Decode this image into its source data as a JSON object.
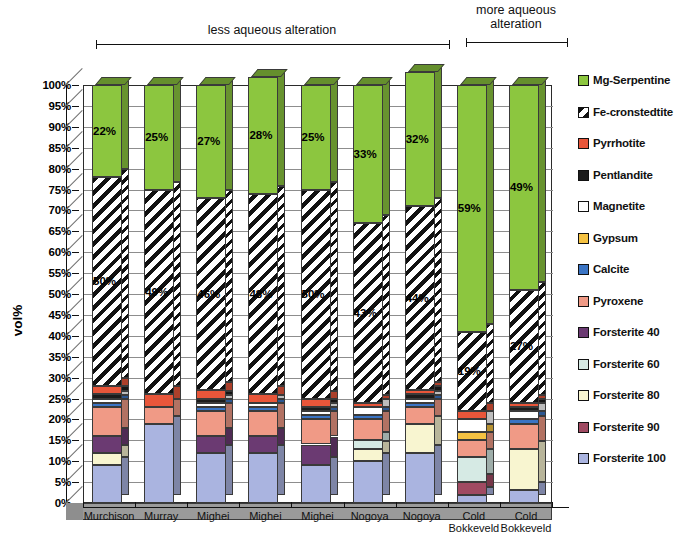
{
  "annotations": {
    "less": "less aqueous alteration",
    "more": "more aqueous\nalteration"
  },
  "axis": {
    "ylabel": "vol%",
    "yticks": [
      "100%",
      "95%",
      "90%",
      "85%",
      "80%",
      "75%",
      "70%",
      "65%",
      "60%",
      "55%",
      "50%",
      "45%",
      "40%",
      "35%",
      "30%",
      "25%",
      "20%",
      "15%",
      "10%",
      "5%",
      "0%"
    ]
  },
  "legend": {
    "items": [
      {
        "label": "Mg-Serpentine",
        "color": "#8cc63f"
      },
      {
        "label": "Fe-cronstedtite",
        "color": "hatch"
      },
      {
        "label": "Pyrrhotite",
        "color": "#e8563a"
      },
      {
        "label": "Pentlandite",
        "color": "#1c1c1c"
      },
      {
        "label": "Magnetite",
        "color": "#ffffff"
      },
      {
        "label": "Gypsum",
        "color": "#f5c242"
      },
      {
        "label": "Calcite",
        "color": "#3a74c4"
      },
      {
        "label": "Pyroxene",
        "color": "#f09a86"
      },
      {
        "label": "Forsterite 40",
        "color": "#6b3a72"
      },
      {
        "label": "Forsterite 60",
        "color": "#d6eae4"
      },
      {
        "label": "Forsterite 80",
        "color": "#f8f5d0"
      },
      {
        "label": "Forsterite 90",
        "color": "#a04a62"
      },
      {
        "label": "Forsterite 100",
        "color": "#aab4e0"
      }
    ]
  },
  "chart_data": {
    "type": "bar",
    "title": "",
    "xlabel": "",
    "ylabel": "vol%",
    "ylim": [
      0,
      100
    ],
    "grid": true,
    "stacked": true,
    "legend_position": "right",
    "categories": [
      "Murchison",
      "Murray",
      "Mighei",
      "Mighei",
      "Mighei",
      "Nogoya",
      "Nogoya",
      "Cold Bokkeveld",
      "Cold Bokkeveld"
    ],
    "annotations": [
      {
        "text": "less aqueous alteration",
        "spans": [
          "Murchison",
          "Nogoya"
        ]
      },
      {
        "text": "more aqueous alteration",
        "spans": [
          "Cold Bokkeveld",
          "Cold Bokkeveld"
        ]
      }
    ],
    "series": [
      {
        "name": "Forsterite 100",
        "color": "#aab4e0",
        "values": [
          9,
          19,
          12,
          12,
          9,
          10,
          12,
          2,
          3
        ]
      },
      {
        "name": "Forsterite 90",
        "color": "#a04a62",
        "values": [
          0,
          0,
          0,
          0,
          0,
          0,
          0,
          3,
          0
        ]
      },
      {
        "name": "Forsterite 80",
        "color": "#f8f5d0",
        "values": [
          3,
          0,
          0,
          0,
          0,
          3,
          7,
          0,
          10
        ]
      },
      {
        "name": "Forsterite 60",
        "color": "#d6eae4",
        "values": [
          0,
          0,
          0,
          0,
          0,
          2,
          0,
          6,
          0
        ]
      },
      {
        "name": "Forsterite 40",
        "color": "#6b3a72",
        "values": [
          4,
          0,
          4,
          4,
          5,
          0,
          0,
          0,
          0
        ]
      },
      {
        "name": "Pyroxene",
        "color": "#f09a86",
        "values": [
          7,
          4,
          6,
          6,
          6,
          5,
          4,
          4,
          6
        ]
      },
      {
        "name": "Calcite",
        "color": "#3a74c4",
        "values": [
          1,
          0,
          1,
          1,
          1,
          1,
          1,
          0,
          1
        ]
      },
      {
        "name": "Gypsum",
        "color": "#f5c242",
        "values": [
          0,
          0,
          0,
          0,
          0,
          0,
          0,
          2,
          0
        ]
      },
      {
        "name": "Magnetite",
        "color": "#ffffff",
        "values": [
          1,
          0,
          1,
          1,
          1,
          2,
          1,
          3,
          2
        ]
      },
      {
        "name": "Pentlandite",
        "color": "#1c1c1c",
        "values": [
          1,
          0,
          1,
          0,
          1,
          0,
          1,
          0,
          1
        ]
      },
      {
        "name": "Pyrrhotite",
        "color": "#e8563a",
        "values": [
          2,
          3,
          2,
          2,
          2,
          1,
          1,
          2,
          1
        ]
      },
      {
        "name": "Fe-cronstedtite",
        "color": "hatch",
        "values": [
          50,
          49,
          46,
          48,
          50,
          43,
          44,
          19,
          27
        ]
      },
      {
        "name": "Mg-Serpentine",
        "color": "#8cc63f",
        "values": [
          22,
          25,
          27,
          28,
          25,
          33,
          32,
          59,
          49
        ]
      }
    ],
    "data_labels": {
      "Mg-Serpentine": [
        "22%",
        "25%",
        "27%",
        "28%",
        "25%",
        "33%",
        "32%",
        "59%",
        "49%"
      ],
      "Fe-cronstedtite": [
        "50%",
        "49%",
        "46%",
        "48%",
        "50%",
        "43%",
        "44%",
        "19%",
        "27%"
      ]
    }
  }
}
